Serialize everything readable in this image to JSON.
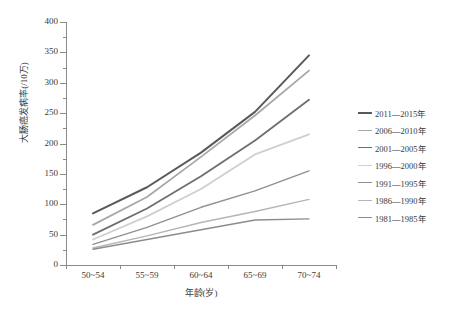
{
  "chart_data": {
    "type": "line",
    "title": "",
    "xlabel": "年龄(岁)",
    "ylabel": "大肠癌发病率(/10万)",
    "categories": [
      "50~54",
      "55~59",
      "60~64",
      "65~69",
      "70~74"
    ],
    "ylim": [
      0,
      400
    ],
    "yticks": [
      0,
      50,
      100,
      150,
      200,
      250,
      300,
      350,
      400
    ],
    "ytick_labels": [
      "0",
      "50",
      "100",
      "150",
      "200",
      "250",
      "300",
      "350",
      "400"
    ],
    "grid": false,
    "legend_position": "right",
    "series": [
      {
        "name": "2011—2015年",
        "color": "#5a5a5a",
        "width": 2.0,
        "values": [
          85,
          128,
          185,
          252,
          345
        ]
      },
      {
        "name": "2006—2010年",
        "color": "#a8a8a8",
        "width": 1.8,
        "values": [
          66,
          112,
          178,
          246,
          320
        ]
      },
      {
        "name": "2001—2005年",
        "color": "#6e6e6e",
        "width": 1.8,
        "values": [
          50,
          93,
          146,
          205,
          272
        ]
      },
      {
        "name": "1996—2000年",
        "color": "#cfcfcf",
        "width": 1.8,
        "values": [
          42,
          80,
          125,
          182,
          215
        ]
      },
      {
        "name": "1991—1995年",
        "color": "#909090",
        "width": 1.4,
        "values": [
          34,
          62,
          95,
          122,
          155
        ]
      },
      {
        "name": "1986—1990年",
        "color": "#b5b5b5",
        "width": 1.4,
        "values": [
          28,
          48,
          70,
          88,
          108
        ]
      },
      {
        "name": "1981—1985年",
        "color": "#8c8c8c",
        "width": 1.4,
        "values": [
          26,
          42,
          58,
          74,
          76
        ]
      }
    ]
  },
  "axis": {
    "x_title": "年龄(岁)",
    "y_title": "大肠癌发病率(/10万)"
  }
}
